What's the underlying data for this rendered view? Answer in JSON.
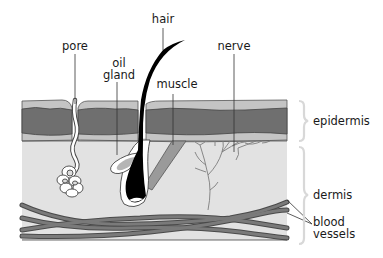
{
  "labels": {
    "pore": "pore",
    "oil_gland_line1": "oil",
    "oil_gland_line2": "gland",
    "hair": "hair",
    "muscle": "muscle",
    "nerve": "nerve",
    "epidermis": "epidermis",
    "dermis": "dermis",
    "blood_vessels_line1": "blood",
    "blood_vessels_line2": "vessels"
  },
  "colors": {
    "background": "#ffffff",
    "epidermis_light": "#c4c4c4",
    "epidermis_dark": "#6f6f6f",
    "dermis": "#e2e2e2",
    "vessel": "#7a7a7a",
    "vessel_outline": "#4a4a4a",
    "hair": "#000000",
    "muscle": "#9a9a9a",
    "nerve": "#7d7d7d",
    "bracket": "#d8d8d8",
    "leader": "#333333"
  }
}
